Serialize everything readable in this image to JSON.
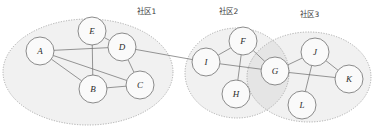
{
  "diagram": {
    "background": "#ffffff",
    "edge_color": "#6a6a6a",
    "node_fill": "#fafafa",
    "node_stroke": "#6e6e6e",
    "ellipse_fill": "#aaaaaa",
    "ellipse_stroke": "#9a9a9a"
  },
  "communities": [
    {
      "id": "c1",
      "label": "社区1",
      "cx": 88,
      "cy": 72,
      "rx": 85,
      "ry": 53,
      "label_x": 137,
      "label_y": 14
    },
    {
      "id": "c2",
      "label": "社区2",
      "cx": 237,
      "cy": 73,
      "rx": 52,
      "ry": 45,
      "label_x": 219,
      "label_y": 14
    },
    {
      "id": "c3",
      "label": "社区3",
      "cx": 309,
      "cy": 77,
      "rx": 62,
      "ry": 45,
      "label_x": 300,
      "label_y": 17
    }
  ],
  "nodes": [
    {
      "id": "A",
      "label": "A",
      "cx": 40,
      "cy": 51,
      "r": 14,
      "community": "c1"
    },
    {
      "id": "B",
      "label": "B",
      "cx": 93,
      "cy": 89,
      "r": 14,
      "community": "c1"
    },
    {
      "id": "C",
      "label": "C",
      "cx": 140,
      "cy": 85,
      "r": 14,
      "community": "c1"
    },
    {
      "id": "D",
      "label": "D",
      "cx": 122,
      "cy": 47,
      "r": 14,
      "community": "c1"
    },
    {
      "id": "E",
      "label": "E",
      "cx": 92,
      "cy": 31,
      "r": 14,
      "community": "c1"
    },
    {
      "id": "I",
      "label": "I",
      "cx": 206,
      "cy": 62,
      "r": 14,
      "community": "c2"
    },
    {
      "id": "F",
      "label": "F",
      "cx": 243,
      "cy": 41,
      "r": 14,
      "community": "c2"
    },
    {
      "id": "H",
      "label": "H",
      "cx": 236,
      "cy": 94,
      "r": 14,
      "community": "c2"
    },
    {
      "id": "G",
      "label": "G",
      "cx": 275,
      "cy": 71,
      "r": 14,
      "community": "c2,c3"
    },
    {
      "id": "J",
      "label": "J",
      "cx": 315,
      "cy": 52,
      "r": 14,
      "community": "c3"
    },
    {
      "id": "K",
      "label": "K",
      "cx": 349,
      "cy": 79,
      "r": 14,
      "community": "c3"
    },
    {
      "id": "L",
      "label": "L",
      "cx": 302,
      "cy": 105,
      "r": 14,
      "community": "c3"
    }
  ],
  "edges": [
    {
      "from": "A",
      "to": "D"
    },
    {
      "from": "A",
      "to": "B"
    },
    {
      "from": "A",
      "to": "C"
    },
    {
      "from": "B",
      "to": "C"
    },
    {
      "from": "B",
      "to": "E"
    },
    {
      "from": "E",
      "to": "D"
    },
    {
      "from": "D",
      "to": "C"
    },
    {
      "from": "D",
      "to": "I"
    },
    {
      "from": "I",
      "to": "F"
    },
    {
      "from": "I",
      "to": "G"
    },
    {
      "from": "F",
      "to": "H"
    },
    {
      "from": "F",
      "to": "G"
    },
    {
      "from": "G",
      "to": "J"
    },
    {
      "from": "G",
      "to": "K"
    },
    {
      "from": "J",
      "to": "K"
    },
    {
      "from": "J",
      "to": "L"
    }
  ]
}
